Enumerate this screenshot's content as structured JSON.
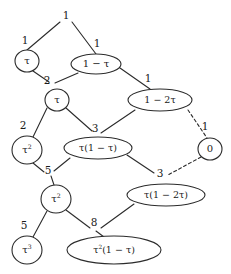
{
  "figure": {
    "type": "node-link-diagram",
    "style": "hand-drawn lattice / tree of Stern-Brocot style expressions",
    "stroke_color": "#2b2b2b",
    "text_color": "#1a1a1a",
    "background_color": "#ffffff"
  },
  "nodes": [
    {
      "id": "n_tau",
      "label": "τ",
      "shape": "circle",
      "cx": 27,
      "cy": 61,
      "rx": 12,
      "ry": 11
    },
    {
      "id": "n_1mtau",
      "label": "1 − τ",
      "shape": "ellipse",
      "cx": 96,
      "cy": 64,
      "rx": 25,
      "ry": 10
    },
    {
      "id": "n_tau2",
      "label": "τ",
      "shape": "circle",
      "cx": 57,
      "cy": 100,
      "rx": 12,
      "ry": 11
    },
    {
      "id": "n_1m2tau",
      "label": "1 − 2τ",
      "shape": "ellipse",
      "cx": 160,
      "cy": 100,
      "rx": 32,
      "ry": 11
    },
    {
      "id": "n_tausq_a",
      "label": "τ²",
      "shape": "circle",
      "cx": 27,
      "cy": 150,
      "rx": 15,
      "ry": 14
    },
    {
      "id": "n_tau1mtau",
      "label": "τ(1 − τ)",
      "shape": "ellipse",
      "cx": 98,
      "cy": 148,
      "rx": 34,
      "ry": 11
    },
    {
      "id": "n_zero",
      "label": "0",
      "shape": "circle",
      "cx": 210,
      "cy": 149,
      "rx": 12,
      "ry": 11
    },
    {
      "id": "n_tausq_b",
      "label": "τ²",
      "shape": "circle",
      "cx": 56,
      "cy": 199,
      "rx": 15,
      "ry": 14
    },
    {
      "id": "n_tau1m2tau",
      "label": "τ(1 − 2τ)",
      "shape": "ellipse",
      "cx": 166,
      "cy": 195,
      "rx": 39,
      "ry": 11
    },
    {
      "id": "n_taucube",
      "label": "τ³",
      "shape": "circle",
      "cx": 27,
      "cy": 250,
      "rx": 15,
      "ry": 14
    },
    {
      "id": "n_tausq1mtau",
      "label": "τ²(1 − τ)",
      "shape": "ellipse",
      "cx": 114,
      "cy": 250,
      "rx": 47,
      "ry": 14
    }
  ],
  "edges": [
    {
      "id": "e_root_left",
      "label": "1",
      "from": "root",
      "to": "n_tau",
      "x1": 60,
      "y1": 22,
      "x2": 27,
      "y2": 50,
      "dashed": false,
      "label_x": 25,
      "label_y": 40
    },
    {
      "id": "e_root_right",
      "label": "1",
      "from": "root",
      "to": "n_1mtau",
      "x1": 72,
      "y1": 22,
      "x2": 96,
      "y2": 54,
      "dashed": false,
      "label_x": 97,
      "label_y": 43
    },
    {
      "id": "e_tau_j2",
      "label": "2",
      "from": "n_tau",
      "to": "junction-2",
      "x1": 33,
      "y1": 71,
      "x2": 49,
      "y2": 82,
      "dashed": false,
      "label_x": 47,
      "label_y": 80
    },
    {
      "id": "e_1mtau_j2",
      "label": "",
      "from": "n_1mtau",
      "to": "junction-2",
      "x1": 78,
      "y1": 73,
      "x2": 55,
      "y2": 83,
      "dashed": false,
      "label_x": 0,
      "label_y": 0
    },
    {
      "id": "e_1mtau_1m2t",
      "label": "1",
      "from": "n_1mtau",
      "to": "n_1m2tau",
      "x1": 120,
      "y1": 68,
      "x2": 150,
      "y2": 89,
      "dashed": false,
      "label_x": 148,
      "label_y": 78
    },
    {
      "id": "e_tau2_tausq",
      "label": "2",
      "from": "n_tau2",
      "to": "n_tausq_a",
      "x1": 47,
      "y1": 108,
      "x2": 33,
      "y2": 137,
      "dashed": false,
      "label_x": 23,
      "label_y": 125
    },
    {
      "id": "e_tau2_j3",
      "label": "3",
      "from": "n_tau2",
      "to": "junction-3",
      "x1": 66,
      "y1": 108,
      "x2": 92,
      "y2": 131,
      "dashed": false,
      "label_x": 95,
      "label_y": 128
    },
    {
      "id": "e_1m2tau_j3",
      "label": "",
      "from": "n_1m2tau",
      "to": "junction-3",
      "x1": 135,
      "y1": 110,
      "x2": 101,
      "y2": 133,
      "dashed": false,
      "label_x": 0,
      "label_y": 0
    },
    {
      "id": "e_1m2tau_zero",
      "label": "1",
      "from": "n_1m2tau",
      "to": "n_zero",
      "x1": 188,
      "y1": 110,
      "x2": 207,
      "y2": 138,
      "dashed": true,
      "label_x": 205,
      "label_y": 126
    },
    {
      "id": "e_tausq_j5",
      "label": "5",
      "from": "n_tausq_a",
      "to": "junction-5",
      "x1": 33,
      "y1": 163,
      "x2": 44,
      "y2": 172,
      "dashed": false,
      "label_x": 48,
      "label_y": 170
    },
    {
      "id": "e_tau1mtau_j5",
      "label": "",
      "from": "n_tau1mtau",
      "to": "junction-5",
      "x1": 70,
      "y1": 158,
      "x2": 54,
      "y2": 171,
      "dashed": false,
      "label_x": 0,
      "label_y": 0
    },
    {
      "id": "e_tau1mtau_j3b",
      "label": "3",
      "from": "n_tau1mtau",
      "to": "junction-3b",
      "x1": 127,
      "y1": 155,
      "x2": 154,
      "y2": 173,
      "dashed": false,
      "label_x": 160,
      "label_y": 173
    },
    {
      "id": "e_zero_j3b",
      "label": "",
      "from": "n_zero",
      "to": "junction-3b",
      "x1": 201,
      "y1": 157,
      "x2": 168,
      "y2": 175,
      "dashed": true,
      "label_x": 0,
      "label_y": 0
    },
    {
      "id": "e_j5_tausqb",
      "label": "",
      "from": "junction-5",
      "to": "n_tausq_b",
      "x1": 51,
      "y1": 176,
      "x2": 54,
      "y2": 185,
      "dashed": false,
      "label_x": 0,
      "label_y": 0
    },
    {
      "id": "e_tausqb_cube",
      "label": "5",
      "from": "n_tausq_b",
      "to": "n_taucube",
      "x1": 47,
      "y1": 211,
      "x2": 33,
      "y2": 237,
      "dashed": false,
      "label_x": 24,
      "label_y": 225
    },
    {
      "id": "e_tausqb_j8",
      "label": "8",
      "from": "n_tausq_b",
      "to": "junction-8",
      "x1": 66,
      "y1": 210,
      "x2": 90,
      "y2": 228,
      "dashed": false,
      "label_x": 94,
      "label_y": 222
    },
    {
      "id": "e_tau1m2tau_j8",
      "label": "",
      "from": "n_tau1m2tau",
      "to": "junction-8",
      "x1": 134,
      "y1": 204,
      "x2": 101,
      "y2": 228,
      "dashed": false,
      "label_x": 0,
      "label_y": 0
    },
    {
      "id": "e_j8_bottom",
      "label": "",
      "from": "junction-8",
      "to": "n_tausq1mtau",
      "x1": 96,
      "y1": 231,
      "x2": 104,
      "y2": 237,
      "dashed": false,
      "label_x": 0,
      "label_y": 0
    }
  ],
  "root": {
    "label": "1",
    "x": 66,
    "y": 15
  },
  "junction_labels": [
    {
      "id": "junction-2",
      "text": "2",
      "x": 47,
      "y": 80
    },
    {
      "id": "junction-3",
      "text": "3",
      "x": 95,
      "y": 128
    },
    {
      "id": "junction-5",
      "text": "5",
      "x": 48,
      "y": 170
    },
    {
      "id": "junction-3b",
      "text": "3",
      "x": 160,
      "y": 173
    },
    {
      "id": "junction-8",
      "text": "8",
      "x": 94,
      "y": 222
    }
  ]
}
